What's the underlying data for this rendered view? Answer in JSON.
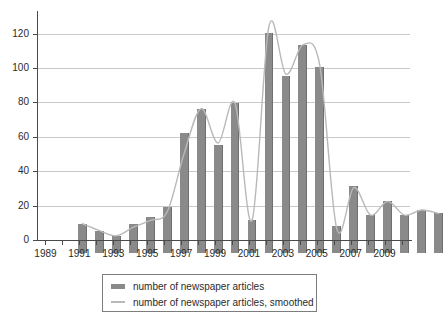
{
  "chart_data": {
    "type": "bar",
    "title": "",
    "xlabel": "",
    "ylabel": "",
    "ylim": [
      0,
      132
    ],
    "xlim": [
      1988.5,
      2010.5
    ],
    "grid": true,
    "legend_position": "bottom-center",
    "ytick_labels": [
      "0",
      "20",
      "40",
      "60",
      "80",
      "100",
      "120"
    ],
    "ytick_values": [
      0,
      20,
      40,
      60,
      80,
      100,
      120
    ],
    "xtick_labels": [
      "1989",
      "1991",
      "1993",
      "1995",
      "1997",
      "1999",
      "2001",
      "2003",
      "2005",
      "2007",
      "2009"
    ],
    "xtick_values": [
      1989,
      1991,
      1993,
      1995,
      1997,
      1999,
      2001,
      2003,
      2005,
      2007,
      2009
    ],
    "categories": [
      1989,
      1990,
      1991,
      1992,
      1993,
      1994,
      1995,
      1996,
      1997,
      1998,
      1999,
      2000,
      2001,
      2002,
      2003,
      2004,
      2005,
      2006,
      2007,
      2008,
      2009,
      2010
    ],
    "series": [
      {
        "name": "number of newspaper articles",
        "render": "bar",
        "color": "#8a8a8a",
        "values": [
          17,
          13,
          10,
          17,
          21,
          27,
          70,
          84,
          63,
          87,
          19,
          128,
          103,
          121,
          108,
          16,
          39,
          22,
          30,
          22,
          25,
          23
        ]
      },
      {
        "name": "number of newspaper articles, smoothed",
        "render": "line",
        "color": "#b9b9b9",
        "values": [
          17,
          13,
          10,
          15,
          19,
          24,
          58,
          84,
          64,
          87,
          19,
          132,
          104,
          121,
          109,
          14,
          38,
          22,
          30,
          22,
          25,
          23
        ]
      }
    ]
  },
  "legend": {
    "items": [
      {
        "label": "number of newspaper articles",
        "swatch": "bar-swatch",
        "color": "#8a8a8a"
      },
      {
        "label": "number of newspaper articles, smoothed",
        "swatch": "line-swatch",
        "color": "#b9b9b9"
      }
    ]
  },
  "caption": {
    "text": "Figure 7: Newspaper coverage over time"
  }
}
